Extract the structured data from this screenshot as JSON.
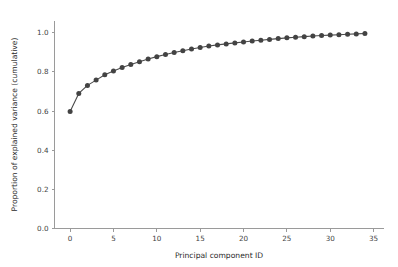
{
  "chart_data": {
    "type": "line",
    "title": "",
    "xlabel": "Principal component ID",
    "ylabel": "Proportion of explained variance (cumulative)",
    "xlim": [
      -1.8,
      36.2
    ],
    "ylim": [
      0.0,
      1.06
    ],
    "xticks": [
      0,
      5,
      10,
      15,
      20,
      25,
      30,
      35
    ],
    "xticklabels": [
      "0",
      "5",
      "10",
      "15",
      "20",
      "25",
      "30",
      "35"
    ],
    "yticks": [
      0.0,
      0.2,
      0.4,
      0.6,
      0.8,
      1.0
    ],
    "yticklabels": [
      "0.0",
      "0.2",
      "0.4",
      "0.6",
      "0.8",
      "1.0"
    ],
    "grid": false,
    "legend": null,
    "marker": "circle",
    "line_color": "#4a4a4a",
    "marker_color": "#434343",
    "background_color": "#ffffff",
    "spine_color": "#9a9a9a",
    "x": [
      0,
      1,
      2,
      3,
      4,
      5,
      6,
      7,
      8,
      9,
      10,
      11,
      12,
      13,
      14,
      15,
      16,
      17,
      18,
      19,
      20,
      21,
      22,
      23,
      24,
      25,
      26,
      27,
      28,
      29,
      30,
      31,
      32,
      33,
      34
    ],
    "values": [
      0.598,
      0.69,
      0.731,
      0.758,
      0.785,
      0.805,
      0.822,
      0.838,
      0.852,
      0.866,
      0.878,
      0.889,
      0.899,
      0.908,
      0.917,
      0.925,
      0.932,
      0.938,
      0.943,
      0.948,
      0.953,
      0.958,
      0.962,
      0.966,
      0.97,
      0.974,
      0.977,
      0.98,
      0.983,
      0.986,
      0.988,
      0.99,
      0.992,
      0.994,
      0.996
    ],
    "series": [
      {
        "name": "Cumulative explained variance",
        "values": [
          0.598,
          0.69,
          0.731,
          0.758,
          0.785,
          0.805,
          0.822,
          0.838,
          0.852,
          0.866,
          0.878,
          0.889,
          0.899,
          0.908,
          0.917,
          0.925,
          0.932,
          0.938,
          0.943,
          0.948,
          0.953,
          0.958,
          0.962,
          0.966,
          0.97,
          0.974,
          0.977,
          0.98,
          0.983,
          0.986,
          0.988,
          0.99,
          0.992,
          0.994,
          0.996
        ]
      }
    ]
  }
}
